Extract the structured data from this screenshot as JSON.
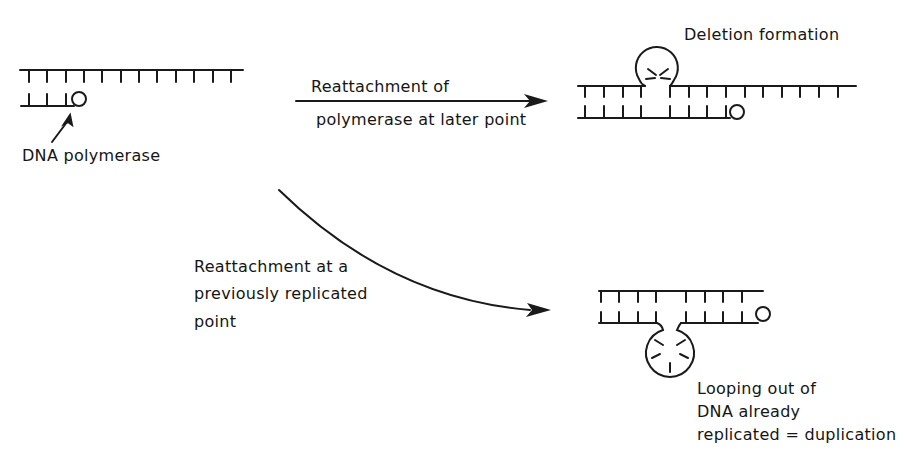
{
  "labels": {
    "dna_polymerase": "DNA polymerase",
    "deletion_formation": "Deletion formation",
    "arrow1_top": "Reattachment of",
    "arrow1_bottom": "polymerase at later point",
    "arrow2_line1": "Reattachment at a",
    "arrow2_line2": "previously replicated",
    "arrow2_line3": "point",
    "dup_line1": "Looping out of",
    "dup_line2": "DNA already",
    "dup_line3": "replicated = duplication"
  },
  "colors": {
    "stroke": "#1a1a1a",
    "background": "#ffffff"
  }
}
